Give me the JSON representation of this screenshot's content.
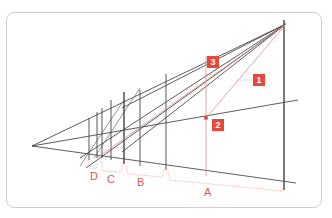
{
  "diagram": {
    "type": "perspective-construction",
    "colors": {
      "line": "#333333",
      "accent": "#e8473c",
      "frame": "#cfcfcf"
    },
    "badges": [
      {
        "id": "1",
        "label": "1"
      },
      {
        "id": "2",
        "label": "2"
      },
      {
        "id": "3",
        "label": "3"
      }
    ],
    "segments": [
      {
        "id": "D",
        "label": "D"
      },
      {
        "id": "C",
        "label": "C"
      },
      {
        "id": "B",
        "label": "B"
      },
      {
        "id": "A",
        "label": "A"
      }
    ]
  }
}
